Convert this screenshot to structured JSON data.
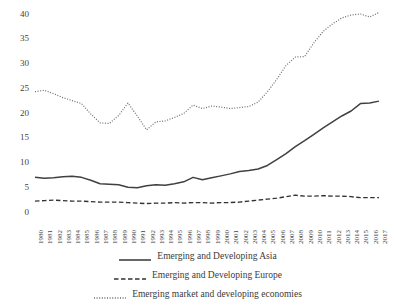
{
  "chart_data": {
    "type": "line",
    "title": "",
    "xlabel": "",
    "ylabel": "",
    "xlim": [
      1980,
      2017
    ],
    "ylim": [
      0,
      40
    ],
    "ytick_labels": [
      "0",
      "5",
      "10",
      "15",
      "20",
      "25",
      "30",
      "35",
      "40"
    ],
    "ytick_values": [
      0,
      5,
      10,
      15,
      20,
      25,
      30,
      35,
      40
    ],
    "grid": false,
    "legend_position": "bottom",
    "categories": [
      "1980",
      "1981",
      "1982",
      "1983",
      "1984",
      "1985",
      "1986",
      "1987",
      "1988",
      "1989",
      "1990",
      "1991",
      "1992",
      "1993",
      "1994",
      "1995",
      "1996",
      "1997",
      "1998",
      "1999",
      "2000",
      "2001",
      "2002",
      "2003",
      "2004",
      "2005",
      "2006",
      "2007",
      "2008",
      "2009",
      "2010",
      "2011",
      "2012",
      "2013",
      "2014",
      "2015",
      "2016",
      "2017"
    ],
    "series": [
      {
        "name": "Emerging and Developing Asia",
        "style": "solid",
        "color": "#404040",
        "values": [
          7.0,
          6.8,
          6.9,
          7.1,
          7.2,
          7.0,
          6.4,
          5.7,
          5.6,
          5.5,
          5.0,
          4.9,
          5.3,
          5.5,
          5.4,
          5.7,
          6.1,
          7.0,
          6.5,
          6.9,
          7.3,
          7.7,
          8.2,
          8.4,
          8.7,
          9.4,
          10.6,
          11.8,
          13.2,
          14.4,
          15.7,
          17.0,
          18.2,
          19.4,
          20.4,
          21.9,
          22.0,
          22.4
        ]
      },
      {
        "name": "Emerging and Developing Europe",
        "style": "dashed",
        "color": "#333333",
        "values": [
          2.2,
          2.3,
          2.4,
          2.3,
          2.2,
          2.2,
          2.1,
          2.0,
          2.0,
          2.0,
          1.9,
          1.8,
          1.7,
          1.8,
          1.8,
          1.9,
          1.8,
          1.9,
          1.9,
          1.8,
          1.9,
          1.9,
          2.0,
          2.2,
          2.4,
          2.6,
          2.8,
          3.1,
          3.4,
          3.2,
          3.2,
          3.3,
          3.2,
          3.2,
          3.1,
          2.9,
          2.9,
          2.9
        ]
      },
      {
        "name": "Emerging market and developing economies",
        "style": "dotted",
        "color": "#6a6a6a",
        "values": [
          24.3,
          24.6,
          23.9,
          23.1,
          22.5,
          21.9,
          19.8,
          18.0,
          17.9,
          19.5,
          22.0,
          19.4,
          16.6,
          18.2,
          18.4,
          19.1,
          19.9,
          21.6,
          20.9,
          21.4,
          21.2,
          20.9,
          21.1,
          21.3,
          22.2,
          24.3,
          26.8,
          29.6,
          31.3,
          31.4,
          34.2,
          36.5,
          38.0,
          39.2,
          39.8,
          40.0,
          39.4,
          40.3
        ]
      }
    ]
  },
  "legend": {
    "items": [
      {
        "label": "Emerging and Developing Asia",
        "style": "solid"
      },
      {
        "label": "Emerging and Developing Europe",
        "style": "dashed"
      },
      {
        "label": "Emerging market and developing economies",
        "style": "dotted"
      }
    ]
  }
}
